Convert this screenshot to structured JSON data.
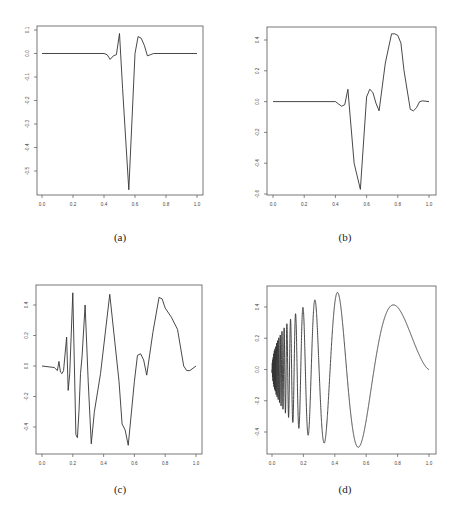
{
  "figure": {
    "captions": [
      "(a)",
      "(b)",
      "(c)",
      "(d)"
    ]
  },
  "chart_data": [
    {
      "type": "line",
      "panel": "(a)",
      "title": "",
      "xlabel": "",
      "ylabel": "",
      "xlim": [
        0.0,
        1.0
      ],
      "ylim": [
        -0.58,
        0.12
      ],
      "xticks": [
        "0.0",
        "0.2",
        "0.4",
        "0.6",
        "0.8",
        "1.0"
      ],
      "yticks": [
        "0.1",
        "0.0",
        "-0.1",
        "-0.2",
        "-0.3",
        "-0.4",
        "-0.5"
      ],
      "grid": false,
      "x": [
        0.0,
        0.4,
        0.42,
        0.44,
        0.46,
        0.48,
        0.5,
        0.52,
        0.56,
        0.6,
        0.62,
        0.64,
        0.66,
        0.68,
        0.7,
        0.72,
        1.0
      ],
      "y": [
        0.0,
        0.0,
        -0.005,
        -0.025,
        -0.01,
        -0.005,
        0.085,
        -0.15,
        -0.58,
        0.0,
        0.072,
        0.065,
        0.035,
        -0.01,
        -0.005,
        0.0,
        0.0
      ]
    },
    {
      "type": "line",
      "panel": "(b)",
      "title": "",
      "xlabel": "",
      "ylabel": "",
      "xlim": [
        0.0,
        1.0
      ],
      "ylim": [
        -0.6,
        0.47
      ],
      "xticks": [
        "0.0",
        "0.2",
        "0.4",
        "0.6",
        "0.8",
        "1.0"
      ],
      "yticks": [
        "0.4",
        "0.2",
        "0.0",
        "-0.2",
        "-0.4",
        "-0.6"
      ],
      "grid": false,
      "x": [
        0.0,
        0.4,
        0.42,
        0.44,
        0.46,
        0.48,
        0.52,
        0.56,
        0.6,
        0.62,
        0.64,
        0.66,
        0.68,
        0.72,
        0.76,
        0.78,
        0.8,
        0.82,
        0.84,
        0.88,
        0.9,
        0.92,
        0.94,
        0.96,
        1.0
      ],
      "y": [
        0.0,
        0.0,
        -0.015,
        -0.03,
        -0.02,
        0.08,
        -0.4,
        -0.57,
        0.03,
        0.08,
        0.06,
        -0.01,
        -0.06,
        0.25,
        0.44,
        0.44,
        0.43,
        0.38,
        0.2,
        -0.05,
        -0.06,
        -0.04,
        0.0,
        0.005,
        0.0
      ]
    },
    {
      "type": "line",
      "panel": "(c)",
      "title": "",
      "xlabel": "",
      "ylabel": "",
      "xlim": [
        0.0,
        1.0
      ],
      "ylim": [
        -0.55,
        0.5
      ],
      "xticks": [
        "0.0",
        "0.2",
        "0.4",
        "0.6",
        "0.8",
        "1.0"
      ],
      "yticks": [
        "0.4",
        "0.2",
        "0.0",
        "-0.2",
        "-0.4"
      ],
      "grid": false,
      "x": [
        0.0,
        0.08,
        0.1,
        0.11,
        0.12,
        0.13,
        0.14,
        0.16,
        0.17,
        0.18,
        0.2,
        0.22,
        0.23,
        0.24,
        0.25,
        0.26,
        0.28,
        0.3,
        0.32,
        0.34,
        0.38,
        0.44,
        0.5,
        0.52,
        0.54,
        0.56,
        0.6,
        0.62,
        0.64,
        0.66,
        0.68,
        0.72,
        0.76,
        0.78,
        0.8,
        0.84,
        0.88,
        0.92,
        0.94,
        0.96,
        1.0
      ],
      "y": [
        0.0,
        -0.01,
        -0.03,
        0.03,
        -0.04,
        -0.05,
        -0.03,
        0.19,
        -0.16,
        -0.05,
        0.48,
        -0.45,
        -0.47,
        -0.3,
        -0.05,
        0.06,
        0.4,
        -0.1,
        -0.51,
        -0.3,
        -0.05,
        0.47,
        -0.1,
        -0.38,
        -0.42,
        -0.52,
        -0.1,
        0.07,
        0.08,
        0.04,
        -0.06,
        0.22,
        0.45,
        0.44,
        0.38,
        0.32,
        0.24,
        0.0,
        -0.03,
        -0.03,
        0.0
      ]
    },
    {
      "type": "line",
      "panel": "(d)",
      "title": "",
      "xlabel": "",
      "ylabel": "",
      "xlim": [
        0.0,
        1.0
      ],
      "ylim": [
        -0.55,
        0.52
      ],
      "xticks": [
        "0.0",
        "0.2",
        "0.4",
        "0.6",
        "0.8",
        "1.0"
      ],
      "yticks": [
        "0.4",
        "0.2",
        "0.0",
        "-0.2",
        "-0.4"
      ],
      "grid": false,
      "function": "doppler: sqrt(x(1-x)) * sin(2*pi*1.05/(x+0.05))",
      "samples": 2048,
      "extrema": {
        "max": {
          "x": 0.42,
          "y": 0.49
        },
        "min": {
          "x": 0.56,
          "y": -0.49
        },
        "last_peak": {
          "x": 0.77,
          "y": 0.41
        }
      }
    }
  ]
}
